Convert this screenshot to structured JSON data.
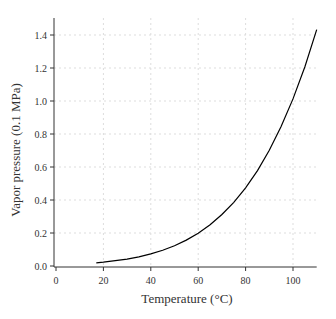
{
  "chart_data": {
    "type": "line",
    "title": "",
    "xlabel": "Temperature (°C)",
    "ylabel": "Vapor pressure (0.1 MPa)",
    "xlim": [
      0,
      110
    ],
    "ylim": [
      0,
      1.45
    ],
    "xticks": [
      0,
      20,
      40,
      60,
      80,
      100
    ],
    "yticks": [
      0.0,
      0.2,
      0.4,
      0.6,
      0.8,
      1.0,
      1.2,
      1.4
    ],
    "ytick_labels": [
      "0.0",
      "0.2",
      "0.4",
      "0.6",
      "0.8",
      "1.0",
      "1.2",
      "1.4"
    ],
    "grid": true,
    "series": [
      {
        "name": "Water vapor pressure",
        "color": "#000000",
        "x": [
          17,
          20,
          25,
          30,
          35,
          40,
          45,
          50,
          55,
          60,
          65,
          70,
          75,
          80,
          85,
          90,
          95,
          100,
          105,
          110
        ],
        "values": [
          0.019,
          0.023,
          0.032,
          0.042,
          0.056,
          0.074,
          0.096,
          0.123,
          0.157,
          0.199,
          0.25,
          0.312,
          0.386,
          0.474,
          0.578,
          0.701,
          0.845,
          1.013,
          1.208,
          1.433
        ]
      }
    ]
  }
}
